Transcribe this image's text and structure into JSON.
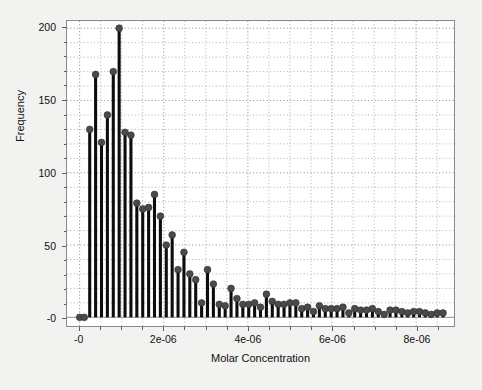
{
  "chart_data": {
    "type": "bar",
    "title": "",
    "subtitle": "",
    "xlabel": "Molar Concentration",
    "ylabel": "Frequency",
    "xlim": [
      -3e-07,
      8.9e-06
    ],
    "ylim": [
      -6,
      205
    ],
    "grid": true,
    "legend": null,
    "marker": "circle",
    "xticks": [
      0,
      2e-06,
      4e-06,
      6e-06,
      8e-06
    ],
    "xtick_labels": [
      "-0",
      "2e-06",
      "4e-06",
      "6e-06",
      "8e-06"
    ],
    "yticks": [
      0,
      50,
      100,
      150,
      200
    ],
    "ytick_labels": [
      "-0",
      "50",
      "100",
      "150",
      "200"
    ],
    "x": [
      0.0,
      1.1e-07,
      2.4e-07,
      3.8e-07,
      5.2e-07,
      6.6e-07,
      8e-07,
      9.4e-07,
      1.08e-06,
      1.22e-06,
      1.36e-06,
      1.5e-06,
      1.64e-06,
      1.78e-06,
      1.92e-06,
      2.06e-06,
      2.2e-06,
      2.34e-06,
      2.48e-06,
      2.62e-06,
      2.76e-06,
      2.9e-06,
      3.04e-06,
      3.18e-06,
      3.32e-06,
      3.46e-06,
      3.6e-06,
      3.74e-06,
      3.88e-06,
      4.02e-06,
      4.16e-06,
      4.3e-06,
      4.44e-06,
      4.58e-06,
      4.72e-06,
      4.86e-06,
      5e-06,
      5.14e-06,
      5.28e-06,
      5.42e-06,
      5.56e-06,
      5.7e-06,
      5.84e-06,
      5.98e-06,
      6.12e-06,
      6.26e-06,
      6.4e-06,
      6.54e-06,
      6.68e-06,
      6.82e-06,
      6.96e-06,
      7.1e-06,
      7.24e-06,
      7.38e-06,
      7.52e-06,
      7.66e-06,
      7.8e-06,
      7.94e-06,
      8.08e-06,
      8.22e-06,
      8.36e-06,
      8.5e-06,
      8.64e-06
    ],
    "values": [
      0,
      0,
      130,
      168,
      121,
      140,
      170,
      200,
      128,
      126,
      79,
      75,
      76,
      85,
      70,
      50,
      57,
      33,
      45,
      30,
      26,
      10,
      33,
      23,
      9,
      8,
      20,
      13,
      9,
      9,
      10,
      7,
      16,
      11,
      9,
      9,
      10,
      10,
      6,
      7,
      4,
      8,
      6,
      6,
      6,
      7,
      3,
      6,
      5,
      5,
      6,
      4,
      2,
      5,
      5,
      4,
      3,
      4,
      4,
      3,
      2,
      3,
      3
    ]
  },
  "axes": {
    "xlabel": "Molar Concentration",
    "ylabel": "Frequency",
    "xtick_labels": [
      "-0",
      "2e-06",
      "4e-06",
      "6e-06",
      "8e-06"
    ],
    "ytick_labels": [
      "-0",
      "50",
      "100",
      "150",
      "200"
    ]
  },
  "colors": {
    "figure_background": "#f2f2f0",
    "plot_background": "#ffffff",
    "stem_line": "#0d0d0d",
    "marker_fill": "#4a4a4a",
    "marker_edge": "#2e2e2e",
    "grid": "#9a9a9a",
    "axis": "#8a8a8a",
    "text": "#111111"
  }
}
